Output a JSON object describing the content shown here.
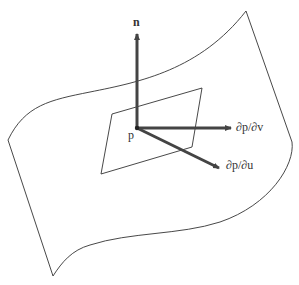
{
  "diagram": {
    "labels": {
      "normal": "n",
      "point": "p",
      "dp_dv": "∂p/∂v",
      "dp_du": "∂p/∂u"
    },
    "colors": {
      "stroke": "#333333",
      "arrow": "#444444",
      "background": "#ffffff"
    }
  }
}
